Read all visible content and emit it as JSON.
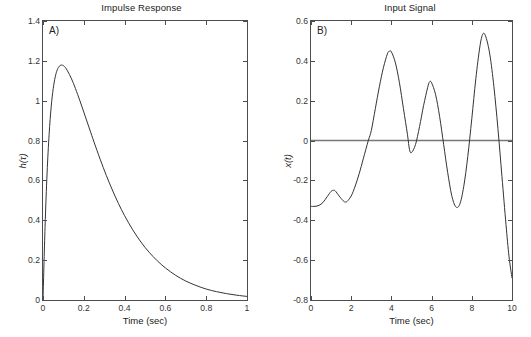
{
  "figure": {
    "background": "#ffffff",
    "curve_color": "#333333",
    "axis_color": "#4d4d4d",
    "zeroline_color": "#777777"
  },
  "chart_data": [
    {
      "type": "line",
      "panel_letter": "A)",
      "title": "Impulse Response",
      "xlabel": "Time (sec)",
      "ylabel": "h(τ)",
      "xlim": [
        0,
        1
      ],
      "ylim": [
        0,
        1.4
      ],
      "xticks": [
        0,
        0.2,
        0.4,
        0.6,
        0.8,
        1
      ],
      "xticklabels": [
        "0",
        "0.2",
        "0.4",
        "0.6",
        "0.8",
        "1"
      ],
      "yticks": [
        0,
        0.2,
        0.4,
        0.6,
        0.8,
        1,
        1.2,
        1.4
      ],
      "yticklabels": [
        "0",
        "0.2",
        "0.4",
        "0.6",
        "0.8",
        "1",
        "1.2",
        "1.4"
      ],
      "grid": false,
      "legend": null,
      "series": [
        {
          "name": "h(tau)",
          "x": [
            0.0,
            0.01,
            0.02,
            0.03,
            0.04,
            0.05,
            0.06,
            0.07,
            0.08,
            0.09,
            0.1,
            0.11,
            0.12,
            0.13,
            0.14,
            0.15,
            0.17,
            0.19,
            0.21,
            0.23,
            0.25,
            0.28,
            0.31,
            0.34,
            0.37,
            0.4,
            0.44,
            0.48,
            0.52,
            0.56,
            0.6,
            0.65,
            0.7,
            0.75,
            0.8,
            0.85,
            0.9,
            0.95,
            1.0
          ],
          "y": [
            0.0,
            0.365,
            0.637,
            0.831,
            0.968,
            1.06,
            1.12,
            1.155,
            1.173,
            1.179,
            1.176,
            1.166,
            1.15,
            1.131,
            1.109,
            1.085,
            1.031,
            0.973,
            0.913,
            0.853,
            0.793,
            0.707,
            0.626,
            0.552,
            0.484,
            0.423,
            0.352,
            0.291,
            0.24,
            0.197,
            0.161,
            0.124,
            0.095,
            0.073,
            0.055,
            0.042,
            0.032,
            0.024,
            0.018
          ]
        }
      ]
    },
    {
      "type": "line",
      "panel_letter": "B)",
      "title": "Input Signal",
      "xlabel": "Time (sec)",
      "ylabel": "x(t)",
      "xlim": [
        0,
        10
      ],
      "ylim": [
        -0.8,
        0.6
      ],
      "xticks": [
        0,
        2,
        4,
        6,
        8,
        10
      ],
      "xticklabels": [
        "0",
        "2",
        "4",
        "6",
        "8",
        "10"
      ],
      "yticks": [
        -0.8,
        -0.6,
        -0.4,
        -0.2,
        0,
        0.2,
        0.4,
        0.6
      ],
      "yticklabels": [
        "-0.8",
        "-0.6",
        "-0.4",
        "-0.2",
        "0",
        "0.2",
        "0.4",
        "0.6"
      ],
      "grid": false,
      "legend": null,
      "zero_reference_line": 0,
      "series": [
        {
          "name": "x(t)",
          "x": [
            0.0,
            0.2,
            0.4,
            0.6,
            0.8,
            1.0,
            1.1,
            1.2,
            1.4,
            1.6,
            1.7,
            1.8,
            2.0,
            2.2,
            2.4,
            2.6,
            2.85,
            3.0,
            3.2,
            3.4,
            3.6,
            3.8,
            3.9,
            4.0,
            4.2,
            4.4,
            4.6,
            4.8,
            4.9,
            5.0,
            5.2,
            5.4,
            5.6,
            5.8,
            5.9,
            6.0,
            6.2,
            6.4,
            6.6,
            6.8,
            7.0,
            7.2,
            7.4,
            7.6,
            7.8,
            8.0,
            8.2,
            8.4,
            8.55,
            8.7,
            8.9,
            9.1,
            9.3,
            9.5,
            9.7,
            9.85,
            10.0
          ],
          "y": [
            -0.33,
            -0.33,
            -0.325,
            -0.31,
            -0.282,
            -0.255,
            -0.25,
            -0.252,
            -0.278,
            -0.302,
            -0.308,
            -0.305,
            -0.278,
            -0.228,
            -0.165,
            -0.092,
            0.0,
            0.05,
            0.16,
            0.27,
            0.365,
            0.435,
            0.448,
            0.445,
            0.39,
            0.29,
            0.16,
            0.03,
            -0.045,
            -0.06,
            -0.02,
            0.07,
            0.175,
            0.265,
            0.295,
            0.29,
            0.23,
            0.12,
            -0.02,
            -0.16,
            -0.275,
            -0.332,
            -0.32,
            -0.23,
            -0.08,
            0.11,
            0.31,
            0.47,
            0.535,
            0.52,
            0.43,
            0.27,
            0.06,
            -0.18,
            -0.42,
            -0.58,
            -0.69
          ]
        }
      ]
    }
  ]
}
